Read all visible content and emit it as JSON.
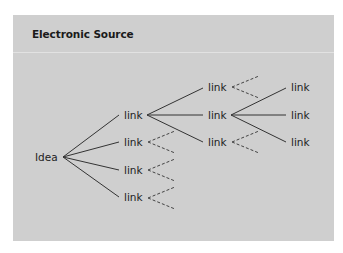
{
  "panel": {
    "title": "Electronic Source",
    "background": "#cfcfcf"
  },
  "diagram": {
    "root": "Idea",
    "level1": [
      "link",
      "link",
      "link",
      "link"
    ],
    "level2": [
      "link",
      "link",
      "link"
    ],
    "level3": [
      "link",
      "link",
      "link"
    ],
    "legend_note": "Solid lines = followed links; dashed lines = unexplored links"
  }
}
